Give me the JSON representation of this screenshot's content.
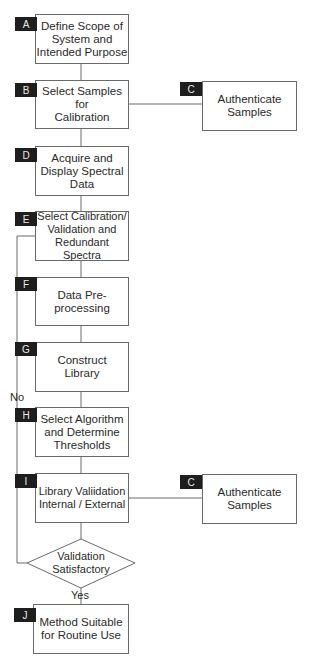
{
  "steps": {
    "A": {
      "tag": "A",
      "text": "Define Scope of\nSystem and\nIntended Purpose"
    },
    "B": {
      "tag": "B",
      "text": "Select Samples\nfor\nCalibration"
    },
    "C1": {
      "tag": "C",
      "text": "Authenticate\nSamples"
    },
    "D": {
      "tag": "D",
      "text": "Acquire and\nDisplay Spectral\nData"
    },
    "E": {
      "tag": "E",
      "text": "Select Calibration/\nValidation and\nRedundant Spectra"
    },
    "F": {
      "tag": "F",
      "text": "Data Pre-\nprocessing"
    },
    "G": {
      "tag": "G",
      "text": "Construct\nLibrary"
    },
    "H": {
      "tag": "H",
      "text": "Select Algorithm\nand Determine\nThresholds"
    },
    "I": {
      "tag": "I",
      "text": "Library Valiidation\nInternal / External"
    },
    "C2": {
      "tag": "C",
      "text": "Authenticate\nSamples"
    },
    "J": {
      "tag": "J",
      "text": "Method Suitable\nfor Routine Use"
    }
  },
  "decision": {
    "text": "Validation\nSatisfactory",
    "no_label": "No",
    "yes_label": "Yes"
  }
}
